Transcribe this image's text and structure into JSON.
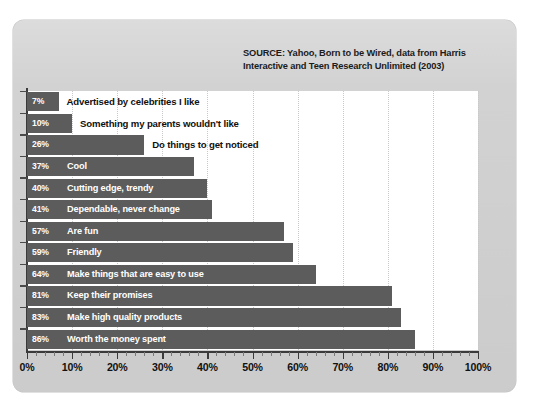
{
  "source_note": "SOURCE: Yahoo, Born to be Wired, data from Harris\nInteractive and Teen Research Unlimited (2003)",
  "colors": {
    "panel_background": "#d2d2d2",
    "plot_background": "#ffffff",
    "bar_fill": "#5c5c5c",
    "bar_text": "#ffffff",
    "axis": "#3a3a3a",
    "gridline": "#c9c9c9",
    "outside_label_text": "#111111"
  },
  "chart_data": {
    "type": "bar",
    "orientation": "horizontal",
    "title": "",
    "subtitle": "",
    "xlabel": "",
    "ylabel": "",
    "xlim": [
      0,
      100
    ],
    "grid": true,
    "legend": false,
    "value_suffix": "%",
    "xticks": [
      0,
      10,
      20,
      30,
      40,
      50,
      60,
      70,
      80,
      90,
      100
    ],
    "xticklabels": [
      "0%",
      "10%",
      "20%",
      "30%",
      "40%",
      "50%",
      "60%",
      "70%",
      "80%",
      "90%",
      "100%"
    ],
    "categories": [
      "Advertised by celebrities I like",
      "Something my parents wouldn't like",
      "Do things to get noticed",
      "Cool",
      "Cutting edge, trendy",
      "Dependable, never change",
      "Are fun",
      "Friendly",
      "Make things that are easy to use",
      "Keep their promises",
      "Make high quality products",
      "Worth the money spent"
    ],
    "values": [
      7,
      10,
      26,
      37,
      40,
      41,
      57,
      59,
      64,
      81,
      83,
      86
    ],
    "value_labels": [
      "7%",
      "10%",
      "26%",
      "37%",
      "40%",
      "41%",
      "57%",
      "59%",
      "64%",
      "81%",
      "83%",
      "86%"
    ],
    "label_placement": [
      "outside",
      "outside",
      "outside",
      "inside",
      "inside",
      "inside",
      "inside",
      "inside",
      "inside",
      "inside",
      "inside",
      "inside"
    ],
    "bars": [
      {
        "label": "Advertised by celebrities I like",
        "value": 7,
        "value_label": "7%",
        "placement": "outside"
      },
      {
        "label": "Something my parents wouldn't like",
        "value": 10,
        "value_label": "10%",
        "placement": "outside"
      },
      {
        "label": "Do things to get noticed",
        "value": 26,
        "value_label": "26%",
        "placement": "outside"
      },
      {
        "label": "Cool",
        "value": 37,
        "value_label": "37%",
        "placement": "inside"
      },
      {
        "label": "Cutting edge, trendy",
        "value": 40,
        "value_label": "40%",
        "placement": "inside"
      },
      {
        "label": "Dependable, never change",
        "value": 41,
        "value_label": "41%",
        "placement": "inside"
      },
      {
        "label": "Are fun",
        "value": 57,
        "value_label": "57%",
        "placement": "inside"
      },
      {
        "label": "Friendly",
        "value": 59,
        "value_label": "59%",
        "placement": "inside"
      },
      {
        "label": "Make things that are easy to use",
        "value": 64,
        "value_label": "64%",
        "placement": "inside"
      },
      {
        "label": "Keep their promises",
        "value": 81,
        "value_label": "81%",
        "placement": "inside"
      },
      {
        "label": "Make high quality products",
        "value": 83,
        "value_label": "83%",
        "placement": "inside"
      },
      {
        "label": "Worth the money spent",
        "value": 86,
        "value_label": "86%",
        "placement": "inside"
      }
    ]
  }
}
